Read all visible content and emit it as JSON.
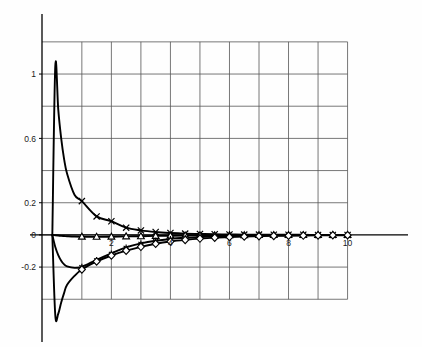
{
  "figure": {
    "background_color": "#ffffff",
    "grid_color": "#555555",
    "curve_color": "#000000",
    "axis_color": "#000000"
  },
  "chart_data": {
    "type": "line",
    "title": "",
    "subtitle": "",
    "xlabel": "",
    "ylabel": "",
    "xlim": [
      -0.35,
      11.2
    ],
    "ylim": [
      -0.56,
      1.28
    ],
    "grid": true,
    "grid_x": [
      1,
      2,
      3,
      4,
      5,
      6,
      7,
      8,
      9,
      10
    ],
    "grid_y": [
      1.2,
      1.0,
      0.8,
      0.6,
      0.4,
      0.2,
      0.0,
      -0.2,
      -0.4
    ],
    "legend": "none",
    "legend_position": "none",
    "xticks": [
      2,
      4,
      6,
      8,
      10
    ],
    "xtick_labels": [
      "2",
      "4",
      "6",
      "8",
      "10"
    ],
    "yticks": [
      1.0,
      0.6,
      0.2,
      0.0,
      -0.2
    ],
    "ytick_labels": [
      "1",
      "0.6",
      "0.2",
      "0",
      "-0.2"
    ],
    "x": [
      0.0,
      0.1,
      0.2,
      0.3,
      0.4,
      0.5,
      0.75,
      1.0,
      1.5,
      2.0,
      2.5,
      3.0,
      3.5,
      4.0,
      4.5,
      5.0,
      5.5,
      6.0,
      6.5,
      7.0,
      7.5,
      8.0,
      8.5,
      9.0,
      9.5,
      10.0
    ],
    "marker_x": [
      1.0,
      1.5,
      2.0,
      2.5,
      3.0,
      3.5,
      4.0,
      4.5,
      5.0,
      5.5,
      6.0,
      6.5,
      7.0,
      7.5,
      8.0,
      8.5,
      9.0,
      9.5,
      10.0
    ],
    "series": [
      {
        "name": "series-x-cross",
        "marker": "x-cross",
        "values": [
          0.0,
          1.05,
          0.78,
          0.6,
          0.47,
          0.38,
          0.25,
          0.21,
          0.115,
          0.085,
          0.045,
          0.028,
          0.018,
          0.012,
          0.008,
          0.006,
          0.004,
          0.003,
          0.002,
          0.002,
          0.001,
          0.001,
          0.001,
          0.0,
          0.0,
          0.0
        ]
      },
      {
        "name": "series-triangle",
        "marker": "triangle",
        "values": [
          0.0,
          -0.002,
          -0.004,
          -0.006,
          -0.007,
          -0.008,
          -0.01,
          -0.011,
          -0.012,
          -0.011,
          -0.009,
          -0.008,
          -0.006,
          -0.005,
          -0.004,
          -0.003,
          -0.003,
          -0.002,
          -0.002,
          -0.001,
          -0.001,
          -0.001,
          -0.001,
          0.0,
          0.0,
          0.0
        ]
      },
      {
        "name": "series-asterisk",
        "marker": "asterisk",
        "values": [
          0.0,
          -0.075,
          -0.125,
          -0.16,
          -0.183,
          -0.196,
          -0.205,
          -0.198,
          -0.155,
          -0.115,
          -0.078,
          -0.053,
          -0.036,
          -0.025,
          -0.018,
          -0.013,
          -0.009,
          -0.007,
          -0.005,
          -0.004,
          -0.003,
          -0.002,
          -0.002,
          -0.001,
          -0.001,
          0.0
        ]
      },
      {
        "name": "series-diamond",
        "marker": "diamond",
        "values": [
          0.0,
          -0.5,
          -0.49,
          -0.42,
          -0.36,
          -0.31,
          -0.255,
          -0.215,
          -0.165,
          -0.128,
          -0.098,
          -0.074,
          -0.055,
          -0.041,
          -0.031,
          -0.023,
          -0.017,
          -0.013,
          -0.01,
          -0.008,
          -0.006,
          -0.005,
          -0.004,
          -0.003,
          -0.002,
          -0.002
        ]
      }
    ]
  }
}
